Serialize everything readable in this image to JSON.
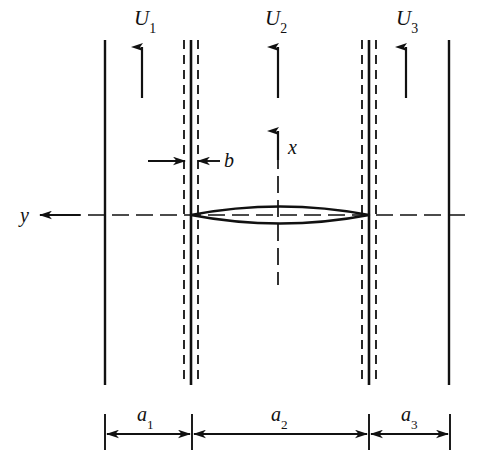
{
  "figure": {
    "background_color": "#ffffff",
    "line_color": "#111111",
    "canvas": {
      "width": 477,
      "height": 452
    }
  },
  "velocity_labels": [
    {
      "name": "U1",
      "base": "U",
      "subscript": "1",
      "text": "U1",
      "x": 135,
      "y": 8
    },
    {
      "name": "U2",
      "base": "U",
      "subscript": "2",
      "text": "U2",
      "x": 266,
      "y": 8
    },
    {
      "name": "U3",
      "base": "U",
      "subscript": "3",
      "text": "U3",
      "x": 397,
      "y": 8
    }
  ],
  "dimension_labels": [
    {
      "name": "a1",
      "base": "a",
      "subscript": "1",
      "text": "a1",
      "x": 138,
      "y": 404
    },
    {
      "name": "a2",
      "base": "a",
      "subscript": "2",
      "text": "a2",
      "x": 272,
      "y": 404
    },
    {
      "name": "a3",
      "base": "a",
      "subscript": "3",
      "text": "a3",
      "x": 402,
      "y": 404
    }
  ],
  "axis_labels": [
    {
      "name": "x-axis-label",
      "text": "x",
      "x": 289,
      "y": 137
    },
    {
      "name": "y-axis-label",
      "text": "y",
      "x": 21,
      "y": 205
    }
  ],
  "thickness_label": {
    "name": "b-label",
    "text": "b",
    "x": 224,
    "y": 149
  },
  "geometry": {
    "walls": [
      {
        "name": "outer-wall-left",
        "x": 105,
        "y_top": 40,
        "y_bottom": 385
      },
      {
        "name": "outer-wall-right",
        "x": 449,
        "y_top": 40,
        "y_bottom": 385
      }
    ],
    "plates": [
      {
        "name": "plate-left",
        "solid_x": 191,
        "dashed_left_x": 184,
        "dashed_right_x": 198,
        "y_top": 40,
        "y_bottom": 385
      },
      {
        "name": "plate-right",
        "solid_x": 369,
        "dashed_left_x": 362,
        "dashed_right_x": 376,
        "y_top": 40,
        "y_bottom": 385
      }
    ],
    "centerline": {
      "name": "y-centerline",
      "y": 215,
      "x_start": 40,
      "x_end": 465
    },
    "x_axis": {
      "name": "x-axis-dashed",
      "x": 278,
      "y_top": 133,
      "y_bottom": 285
    },
    "airfoil": {
      "name": "biconvex-airfoil",
      "leading_edge_x": 191,
      "trailing_edge_x": 369,
      "chord_center_y": 215,
      "half_thickness": 11
    },
    "flow_arrows": [
      {
        "name": "flow-arrow-1",
        "x": 142,
        "y_tail": 98,
        "y_head": 45
      },
      {
        "name": "flow-arrow-2",
        "x": 278,
        "y_tail": 98,
        "y_head": 45
      },
      {
        "name": "flow-arrow-3",
        "x": 406,
        "y_tail": 98,
        "y_head": 45
      }
    ],
    "dimension_line": {
      "name": "dimension-line",
      "y": 434,
      "ticks_y_top": 414,
      "ticks_y_bottom": 450,
      "tick_x": [
        105,
        192,
        369,
        450
      ],
      "spans": [
        {
          "name": "a1-span",
          "x_start": 105,
          "x_end": 192
        },
        {
          "name": "a2-span",
          "x_start": 192,
          "x_end": 369
        },
        {
          "name": "a3-span",
          "x_start": 369,
          "x_end": 450
        }
      ]
    },
    "b_dimension": {
      "name": "b-dimension",
      "y": 161,
      "left_arrow": {
        "x_tail": 148,
        "x_head": 183
      },
      "right_arrow": {
        "x_tail": 219,
        "x_head": 199
      },
      "dash_tick_y_top": 146,
      "dash_tick_y_bottom": 176
    },
    "y_arrow": {
      "name": "y-axis-arrow",
      "x_tail": 78,
      "x_head": 38,
      "y": 215
    }
  }
}
